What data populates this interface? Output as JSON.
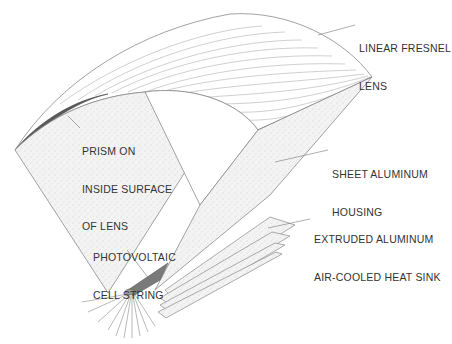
{
  "diagram": {
    "colors": {
      "line": "#8a8a8a",
      "stipple": "#f1f1f1",
      "prism": "#555555",
      "text": "#333333"
    },
    "labels": [
      {
        "id": "fresnel-lens",
        "lines": [
          "LINEAR FRESNEL",
          "LENS"
        ]
      },
      {
        "id": "prism",
        "lines": [
          "PRISM ON",
          "INSIDE SURFACE",
          "OF LENS"
        ]
      },
      {
        "id": "housing",
        "lines": [
          "SHEET ALUMINUM",
          "HOUSING"
        ]
      },
      {
        "id": "heat-sink",
        "lines": [
          "EXTRUDED ALUMINUM",
          "AIR-COOLED HEAT SINK"
        ]
      },
      {
        "id": "pv-cell",
        "lines": [
          "PHOTOVOLTAIC",
          "CELL STRING"
        ]
      }
    ]
  }
}
